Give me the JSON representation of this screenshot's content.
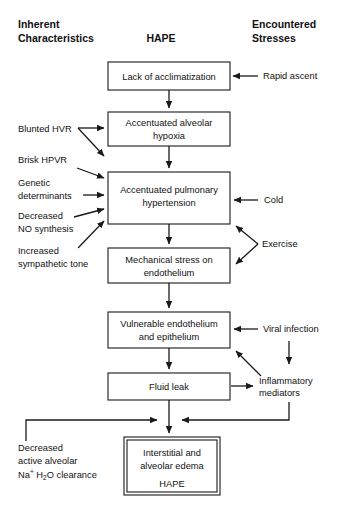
{
  "figure": {
    "background_color": "#ffffff",
    "line_color": "#1a1a1a",
    "text_color": "#111111"
  },
  "headers": {
    "left": {
      "line1": "Inherent",
      "line2": "Characteristics"
    },
    "center": {
      "line1": "HAPE"
    },
    "right": {
      "line1": "Encountered",
      "line2": "Stresses"
    }
  },
  "boxes": [
    {
      "id": "acclimatization",
      "line1": "Lack of acclimatization",
      "line2": "",
      "line3": ""
    },
    {
      "id": "hypoxia",
      "line1": "Accentuated alveolar",
      "line2": "hypoxia",
      "line3": ""
    },
    {
      "id": "hypertension",
      "line1": "Accentuated pulmonary",
      "line2": "hypertension",
      "line3": ""
    },
    {
      "id": "mechanical-stress",
      "line1": "Mechanical stress on",
      "line2": "endothelium",
      "line3": ""
    },
    {
      "id": "vulnerable",
      "line1": "Vulnerable endothelium",
      "line2": "and epithelium",
      "line3": ""
    },
    {
      "id": "fluid-leak",
      "line1": "Fluid leak",
      "line2": "",
      "line3": ""
    },
    {
      "id": "edema",
      "line1": "Interstitial and",
      "line2": "alveolar edema",
      "line3": "HAPE"
    }
  ],
  "left_factors": [
    {
      "id": "blunted-hvr",
      "line1": "Blunted HVR",
      "line2": ""
    },
    {
      "id": "brisk-hpvr",
      "line1": "Brisk HPVR",
      "line2": ""
    },
    {
      "id": "genetic",
      "line1": "Genetic",
      "line2": "determinants"
    },
    {
      "id": "no-synthesis",
      "line1": "Decreased",
      "line2": "NO synthesis"
    },
    {
      "id": "sympathetic",
      "line1": "Increased",
      "line2": "sympathetic tone"
    },
    {
      "id": "na-clearance",
      "line1": "Decreased",
      "line2": "active alveolar",
      "line3_a": "Na",
      "line3_sup": "+",
      "line3_b": " H",
      "line3_sub": "2",
      "line3_c": "O clearance"
    }
  ],
  "right_stresses": [
    {
      "id": "rapid-ascent",
      "line1": "Rapid ascent",
      "line2": ""
    },
    {
      "id": "cold",
      "line1": "Cold",
      "line2": ""
    },
    {
      "id": "exercise",
      "line1": "Exercise",
      "line2": ""
    },
    {
      "id": "viral-infection",
      "line1": "Viral infection",
      "line2": ""
    },
    {
      "id": "inflammatory",
      "line1": "Inflammatory",
      "line2": "mediators"
    }
  ]
}
